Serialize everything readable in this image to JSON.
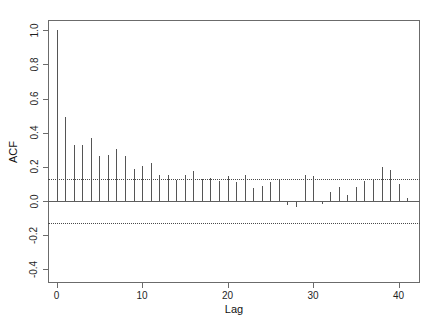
{
  "figure": {
    "width": 436,
    "height": 325,
    "background": "#ffffff",
    "foreground": "#555555",
    "box_color": "#6b6b6b"
  },
  "chart_data": {
    "type": "bar",
    "title": "",
    "subtitle": "",
    "xlabel": "Lag",
    "ylabel": "ACF",
    "xlim": [
      -1,
      42.5
    ],
    "ylim": [
      -0.48,
      1.06
    ],
    "grid": false,
    "legend": null,
    "x_ticks": [
      0,
      10,
      20,
      30,
      40
    ],
    "x_tick_labels": [
      "0",
      "10",
      "20",
      "30",
      "40"
    ],
    "y_ticks": [
      1.0,
      0.8,
      0.6,
      0.4,
      0.2,
      0.0,
      -0.2,
      -0.4
    ],
    "y_tick_labels": [
      "1.0",
      "0.8",
      "0.6",
      "0.4",
      "0.2",
      "0.0",
      "-0.2",
      "-0.4"
    ],
    "zero_line": 0.0,
    "confidence_bounds": [
      0.128,
      -0.128
    ],
    "confidence_style": "dotted",
    "x": [
      0,
      1,
      2,
      3,
      4,
      5,
      6,
      7,
      8,
      9,
      10,
      11,
      12,
      13,
      14,
      15,
      16,
      17,
      18,
      19,
      20,
      21,
      22,
      23,
      24,
      25,
      26,
      27,
      28,
      29,
      30,
      31,
      32,
      33,
      34,
      35,
      36,
      37,
      38,
      39,
      40,
      41
    ],
    "categories": [
      "0",
      "1",
      "2",
      "3",
      "4",
      "5",
      "6",
      "7",
      "8",
      "9",
      "10",
      "11",
      "12",
      "13",
      "14",
      "15",
      "16",
      "17",
      "18",
      "19",
      "20",
      "21",
      "22",
      "23",
      "24",
      "25",
      "26",
      "27",
      "28",
      "29",
      "30",
      "31",
      "32",
      "33",
      "34",
      "35",
      "36",
      "37",
      "38",
      "39",
      "40",
      "41"
    ],
    "values": [
      1.0,
      0.49,
      0.33,
      0.33,
      0.37,
      0.265,
      0.27,
      0.305,
      0.265,
      0.185,
      0.205,
      0.225,
      0.15,
      0.155,
      0.125,
      0.155,
      0.175,
      0.13,
      0.135,
      0.115,
      0.145,
      0.11,
      0.155,
      0.075,
      0.09,
      0.11,
      0.125,
      -0.025,
      -0.035,
      0.155,
      0.145,
      -0.015,
      0.055,
      0.08,
      0.035,
      0.08,
      0.115,
      0.13,
      0.2,
      0.18,
      0.1,
      0.015
    ]
  },
  "axes": {
    "y_title": "ACF",
    "x_title": "Lag"
  }
}
